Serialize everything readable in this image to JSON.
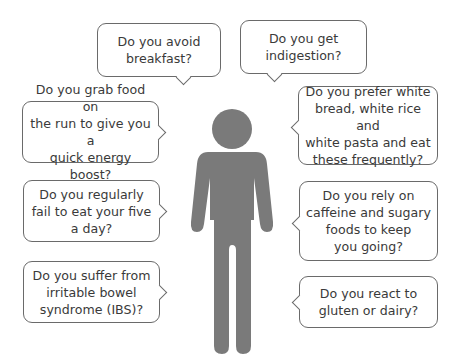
{
  "figure": {
    "icon": "person-silhouette-icon",
    "color": "#7a7a7a"
  },
  "bubbles": [
    {
      "id": "avoid-breakfast",
      "text": "Do you avoid\nbreakfast?",
      "tail": "down"
    },
    {
      "id": "indigestion",
      "text": "Do you get\nindigestion?",
      "tail": "down"
    },
    {
      "id": "grab-food",
      "text": "Do you grab food on\nthe run to give you a\nquick energy boost?",
      "tail": "right"
    },
    {
      "id": "white-bread",
      "text": "Do you prefer white\nbread, white rice and\nwhite pasta and eat\nthese frequently?",
      "tail": "left"
    },
    {
      "id": "five-a-day",
      "text": "Do you regularly\nfail to eat your five\na day?",
      "tail": "right"
    },
    {
      "id": "caffeine",
      "text": "Do you rely on\ncaffeine and sugary\nfoods to keep\nyou going?",
      "tail": "left"
    },
    {
      "id": "ibs",
      "text": "Do you suffer from\nirritable bowel\nsyndrome (IBS)?",
      "tail": "right"
    },
    {
      "id": "gluten-dairy",
      "text": "Do you react to\ngluten or dairy?",
      "tail": "left"
    }
  ],
  "colors": {
    "figure": "#7a7a7a",
    "bubble_border": "#6a6a6a",
    "text": "#3a3a3a",
    "background": "#ffffff"
  }
}
